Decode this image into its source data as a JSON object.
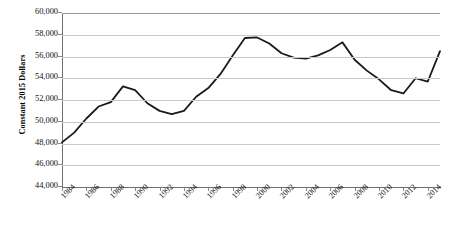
{
  "chart_data": {
    "type": "line",
    "title": "",
    "subtitle": "",
    "xlabel": "",
    "ylabel": "Constant 2015 Dollars",
    "ylim": [
      44000,
      60000
    ],
    "ytick_step": 2000,
    "ytick_labels": [
      "60,000",
      "58,000",
      "56,000",
      "54,000",
      "52,000",
      "50,000",
      "48,000",
      "46,000",
      "44,000"
    ],
    "ytick_values": [
      60000,
      58000,
      56000,
      54000,
      52000,
      50000,
      48000,
      46000,
      44000
    ],
    "xtick_labels": [
      "1984",
      "1986",
      "1988",
      "1990",
      "1992",
      "1994",
      "1996",
      "1998",
      "2000",
      "2002",
      "2004",
      "2006",
      "2008",
      "2010",
      "2012",
      "2014"
    ],
    "xtick_values": [
      1984,
      1986,
      1988,
      1990,
      1992,
      1994,
      1996,
      1998,
      2000,
      2002,
      2004,
      2006,
      2008,
      2010,
      2012,
      2014
    ],
    "xlim": [
      1984,
      2015
    ],
    "grid": true,
    "legend": "none",
    "line_color": "#1a1a1a",
    "line_width": 1.8,
    "gridline_color": "#c9c9c9",
    "axis_color": "#6f6f6f",
    "x": [
      1984,
      1985,
      1986,
      1987,
      1988,
      1989,
      1990,
      1991,
      1992,
      1993,
      1994,
      1995,
      1996,
      1997,
      1998,
      1999,
      2000,
      2001,
      2002,
      2003,
      2004,
      2005,
      2006,
      2007,
      2008,
      2009,
      2010,
      2011,
      2012,
      2013,
      2014,
      2015
    ],
    "series": [
      {
        "name": "Median Household Income",
        "values": [
          48100,
          49000,
          50300,
          51400,
          51800,
          53250,
          52900,
          51700,
          51000,
          50700,
          51000,
          52300,
          53100,
          54400,
          56100,
          57700,
          57750,
          57200,
          56300,
          55900,
          55800,
          56100,
          56600,
          57300,
          55700,
          54700,
          53900,
          52900,
          52600,
          54000,
          53700,
          56500
        ]
      }
    ]
  },
  "axis": {
    "y_title": "Constant 2015 Dollars"
  }
}
